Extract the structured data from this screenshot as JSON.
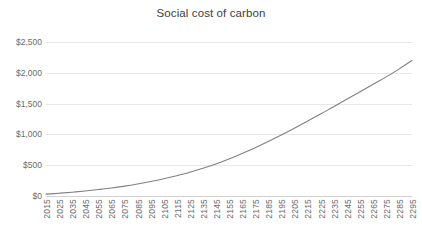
{
  "chart_data": {
    "type": "line",
    "title": "Social cost of carbon",
    "xlabel": "",
    "ylabel": "",
    "grid": true,
    "legend": false,
    "line_color": "#808080",
    "x": [
      2015,
      2025,
      2035,
      2045,
      2055,
      2065,
      2075,
      2085,
      2095,
      2105,
      2115,
      2125,
      2135,
      2145,
      2155,
      2165,
      2175,
      2185,
      2195,
      2205,
      2215,
      2225,
      2235,
      2245,
      2255,
      2265,
      2275,
      2285,
      2295
    ],
    "x_tick_labels": [
      "2015",
      "2025",
      "2035",
      "2045",
      "2055",
      "2065",
      "2075",
      "2085",
      "2095",
      "2105",
      "2115",
      "2125",
      "2135",
      "2145",
      "2155",
      "2165",
      "2175",
      "2185",
      "2195",
      "2205",
      "2215",
      "2225",
      "2235",
      "2245",
      "2255",
      "2265",
      "2275",
      "2285",
      "2295"
    ],
    "values": [
      30,
      45,
      62,
      82,
      105,
      130,
      160,
      195,
      235,
      280,
      330,
      385,
      450,
      520,
      600,
      690,
      785,
      885,
      990,
      1100,
      1215,
      1330,
      1450,
      1570,
      1690,
      1810,
      1930,
      2060,
      2200
    ],
    "ylim": [
      0,
      2500
    ],
    "y_ticks": [
      0,
      500,
      1000,
      1500,
      2000,
      2500
    ],
    "y_tick_labels": [
      "$0",
      "$500",
      "$1,000",
      "$1,500",
      "$2,000",
      "$2,500"
    ],
    "series_name": "Social cost of carbon"
  }
}
